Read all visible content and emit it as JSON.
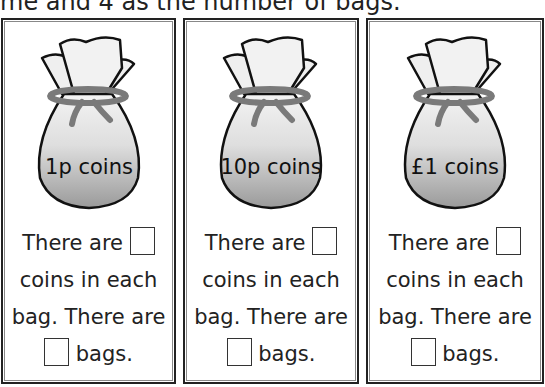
{
  "instruction": "me and 4 as the number of bags.",
  "cards": [
    {
      "bag_label": "1p coins",
      "line1": "There are",
      "line2": "coins in each",
      "line3": "bag. There are",
      "line4": "bags."
    },
    {
      "bag_label": "10p coins",
      "line1": "There are",
      "line2": "coins in each",
      "line3": "bag. There are",
      "line4": "bags."
    },
    {
      "bag_label": "£1 coins",
      "line1": "There are",
      "line2": "coins in each",
      "line3": "bag. There are",
      "line4": "bags."
    }
  ],
  "colors": {
    "border": "#222222",
    "tie": "#7a7a7a",
    "bag_top": "#f2f2f2",
    "bag_bottom": "#9a9a9a"
  }
}
